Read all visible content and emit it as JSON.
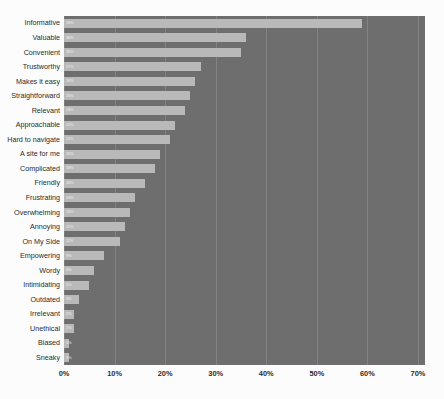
{
  "chart_data": {
    "type": "bar",
    "orientation": "horizontal",
    "title": "",
    "subtitle": "",
    "xlabel": "",
    "ylabel": "",
    "xlim": [
      0,
      70
    ],
    "xtick_labels": [
      "0%",
      "10%",
      "20%",
      "30%",
      "40%",
      "50%",
      "60%",
      "70%"
    ],
    "xticks": [
      0,
      10,
      20,
      30,
      40,
      50,
      60,
      70
    ],
    "grid": true,
    "grid_axis": "x",
    "legend": false,
    "legend_position": "none",
    "value_labels_shown": true,
    "value_label_position": "inside-start",
    "categories": [
      "Informative",
      "Valuable",
      "Convenient",
      "Trustworthy",
      "Makes it easy",
      "Straightforward",
      "Relevant",
      "Approachable",
      "Hard to navigate",
      "A site for me",
      "Complicated",
      "Friendly",
      "Frustrating",
      "Overwhelming",
      "Annoying",
      "On My Side",
      "Empowering",
      "Wordy",
      "Intimidating",
      "Outdated",
      "Irrelevant",
      "Unethical",
      "Biased",
      "Sneaky"
    ],
    "values": [
      59,
      36,
      35,
      27,
      26,
      25,
      24,
      22,
      21,
      19,
      18,
      16,
      14,
      13,
      12,
      11,
      8,
      6,
      5,
      3,
      2,
      2,
      1,
      1
    ],
    "value_labels": [
      "59%",
      "36%",
      "35%",
      "27%",
      "26%",
      "25%",
      "24%",
      "22%",
      "21%",
      "19%",
      "18%",
      "16%",
      "14%",
      "13%",
      "12%",
      "11%",
      "8%",
      "6%",
      "5%",
      "3%",
      "2%",
      "2%",
      "1%",
      "1%"
    ]
  },
  "colors": {
    "plot_background": "#6e6e6e",
    "bar_fill": "#b9b9b9",
    "gridline": "#828282",
    "page_background": "#fcfcfc",
    "axis_text": "#2b2b2b",
    "value_label_text": "#f0f0f0"
  }
}
